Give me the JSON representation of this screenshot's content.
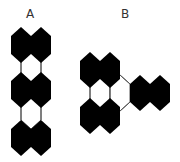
{
  "figure": {
    "panels": [
      {
        "label": "A",
        "description": "Vertical chain of three pairs of fused black hexagons joined by white (outlined) hexagons"
      },
      {
        "label": "B",
        "description": "Two stacked pairs of black hexagons on the left with a horizontal pair of black hexagons branching to the right via a white hexagon"
      }
    ],
    "colors": {
      "filled": "#000000",
      "empty_stroke": "#555555",
      "background": "#ffffff"
    }
  }
}
